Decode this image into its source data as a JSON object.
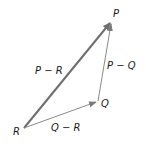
{
  "diagram": {
    "type": "vector-triangle",
    "points": {
      "P": {
        "label": "P",
        "x": 111,
        "y": 21
      },
      "Q": {
        "label": "Q",
        "x": 98,
        "y": 101
      },
      "R": {
        "label": "R",
        "x": 24,
        "y": 128
      }
    },
    "edges": [
      {
        "from": "R",
        "to": "P",
        "label": "P − R",
        "style": "thick"
      },
      {
        "from": "Q",
        "to": "P",
        "label": "P − Q",
        "style": "thin"
      },
      {
        "from": "R",
        "to": "Q",
        "label": "Q − R",
        "style": "thin"
      }
    ],
    "colors": {
      "thick_arrow": "#6e6e6e",
      "thin_arrow": "#8a8a8a",
      "text": "#1a1a1a"
    }
  }
}
